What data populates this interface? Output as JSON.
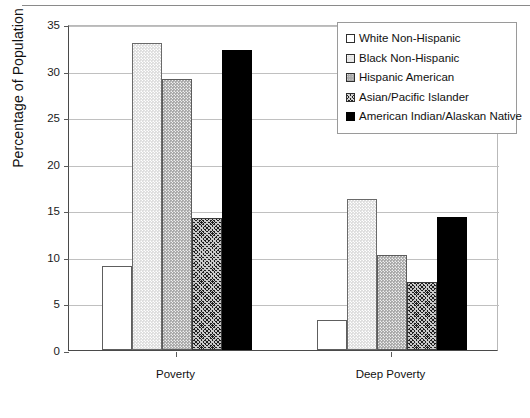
{
  "chart_data": {
    "type": "bar",
    "title": "",
    "xlabel": "",
    "ylabel": "Percentage of Population",
    "ylim": [
      0,
      35
    ],
    "ytick_labels": [
      "0",
      "5",
      "10",
      "15",
      "20",
      "25",
      "30",
      "35"
    ],
    "ytick_values": [
      0,
      5,
      10,
      15,
      20,
      25,
      30,
      35
    ],
    "grid": true,
    "legend_position": "top-right",
    "categories": [
      "Poverty",
      "Deep Poverty"
    ],
    "series": [
      {
        "name": "White Non-Hispanic",
        "values": [
          9.0,
          3.2
        ],
        "fill": "white"
      },
      {
        "name": "Black Non-Hispanic",
        "values": [
          33.0,
          16.2
        ],
        "fill": "light-dotted"
      },
      {
        "name": "Hispanic American",
        "values": [
          29.1,
          10.2
        ],
        "fill": "medium-dotted"
      },
      {
        "name": "Asian/Pacific Islander",
        "values": [
          14.2,
          7.3
        ],
        "fill": "dark-crosshatch"
      },
      {
        "name": "American Indian/Alaskan Native",
        "values": [
          32.2,
          14.3
        ],
        "fill": "solid-black"
      }
    ]
  },
  "legend": {
    "items": [
      {
        "label": "White Non-Hispanic"
      },
      {
        "label": "Black Non-Hispanic"
      },
      {
        "label": "Hispanic American"
      },
      {
        "label": "Asian/Pacific Islander"
      },
      {
        "label": "American Indian/Alaskan Native"
      }
    ]
  },
  "colors": {
    "axis": "#4a4a4a",
    "gridline": "#c0c0c0",
    "text": "#111111",
    "black_series": "#000000"
  }
}
